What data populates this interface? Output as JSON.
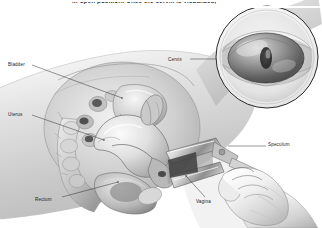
{
  "figure": {
    "type": "medical-anatomical-illustration",
    "style": "grayscale pen-and-ink / airbrush medical illustration",
    "background_color": "#ffffff",
    "ink_color": "#1b1b1b",
    "caption": {
      "text": "in open position. Once the cervix is visualized,",
      "position": "top",
      "clipped": true
    },
    "labels": [
      {
        "id": "bladder",
        "text": "Bladder",
        "leader": "line from label to bladder in midsagittal section"
      },
      {
        "id": "uterus",
        "text": "Uterus",
        "leader": "line from label to uterine body"
      },
      {
        "id": "rectum",
        "text": "Rectum",
        "leader": "line from label to rectum"
      },
      {
        "id": "vagina",
        "text": "Vagina",
        "leader": "line from label to vaginal canal"
      },
      {
        "id": "cervix",
        "text": "Cervix",
        "leader": "line from label to circular inset of cervix"
      },
      {
        "id": "speculum",
        "text": "Speculum",
        "leader": "line from label to speculum handle in gloved hand"
      }
    ],
    "inset": {
      "id": "cervix-inset",
      "shape": "circle",
      "depicts": "magnified view of cervix and external os seen through the open speculum blades",
      "center_x": 267,
      "center_y": 57,
      "radius": 52
    },
    "scene": {
      "main_view": "midsagittal cross-section of female pelvis showing bladder, uterus, vagina, rectum and sacrum",
      "instrument": "bivalve vaginal speculum inserted into vagina, blades open",
      "operator": "gloved hand holding the speculum handle at lower right"
    }
  }
}
